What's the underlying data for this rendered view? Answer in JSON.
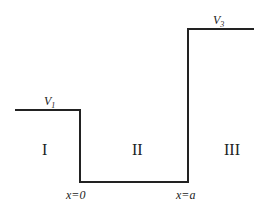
{
  "diagram": {
    "type": "step potential well",
    "potential_labels": {
      "left": {
        "symbol": "V",
        "subscript": "1"
      },
      "right": {
        "symbol": "V",
        "subscript": "3"
      }
    },
    "regions": [
      "I",
      "II",
      "III"
    ],
    "boundaries": [
      "x=0",
      "x=a"
    ],
    "line_color": "#222222"
  }
}
